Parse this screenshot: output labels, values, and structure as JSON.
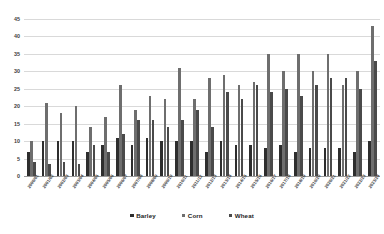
{
  "chart_data": {
    "type": "bar",
    "title": "",
    "xlabel": "",
    "ylabel": "",
    "ylim": [
      0,
      45
    ],
    "yticks": [
      0,
      5,
      10,
      15,
      20,
      25,
      30,
      35,
      40,
      45
    ],
    "grid": true,
    "legend_position": "bottom",
    "categories": [
      "2000/01",
      "2001/02",
      "2002/03",
      "2003/04",
      "2004/05",
      "2005/06",
      "2006/07",
      "2007/08",
      "2008/09",
      "2009/10",
      "2010/11",
      "2011/12",
      "2012/13",
      "2013/14",
      "2014/15",
      "2015/16",
      "2016/17",
      "2017/18",
      "2018/19",
      "2019/20",
      "2020/21",
      "2021/22",
      "2022/23",
      "2023/24"
    ],
    "series": [
      {
        "name": "Barley",
        "color": "#2e2e2e",
        "values": [
          7,
          10,
          10,
          10,
          7,
          9,
          11,
          9,
          11,
          10,
          10,
          10,
          7,
          10,
          9,
          9,
          8,
          9,
          7,
          8,
          8,
          8,
          7,
          10
        ]
      },
      {
        "name": "Corn",
        "color": "#6e6e6e",
        "values": [
          10,
          21,
          18,
          20,
          14,
          17,
          26,
          19,
          23,
          22,
          31,
          22,
          28,
          29,
          26,
          27,
          35,
          30,
          35,
          30,
          35,
          26,
          30,
          43
        ]
      },
      {
        "name": "Wheat",
        "color": "#4a4a4a",
        "values": [
          4,
          3.5,
          4,
          3.5,
          9,
          7,
          12,
          16,
          16,
          14,
          16,
          19,
          14,
          24,
          22,
          26,
          24,
          25,
          23,
          26,
          28,
          28,
          25,
          33
        ]
      }
    ]
  },
  "legend": {
    "items": [
      {
        "label": "Barley",
        "color": "#2e2e2e"
      },
      {
        "label": "Corn",
        "color": "#6e6e6e"
      },
      {
        "label": "Wheat",
        "color": "#4a4a4a"
      }
    ]
  },
  "axis": {
    "y_tick_labels": [
      "0",
      "5",
      "10",
      "15",
      "20",
      "25",
      "30",
      "35",
      "40",
      "45"
    ]
  }
}
